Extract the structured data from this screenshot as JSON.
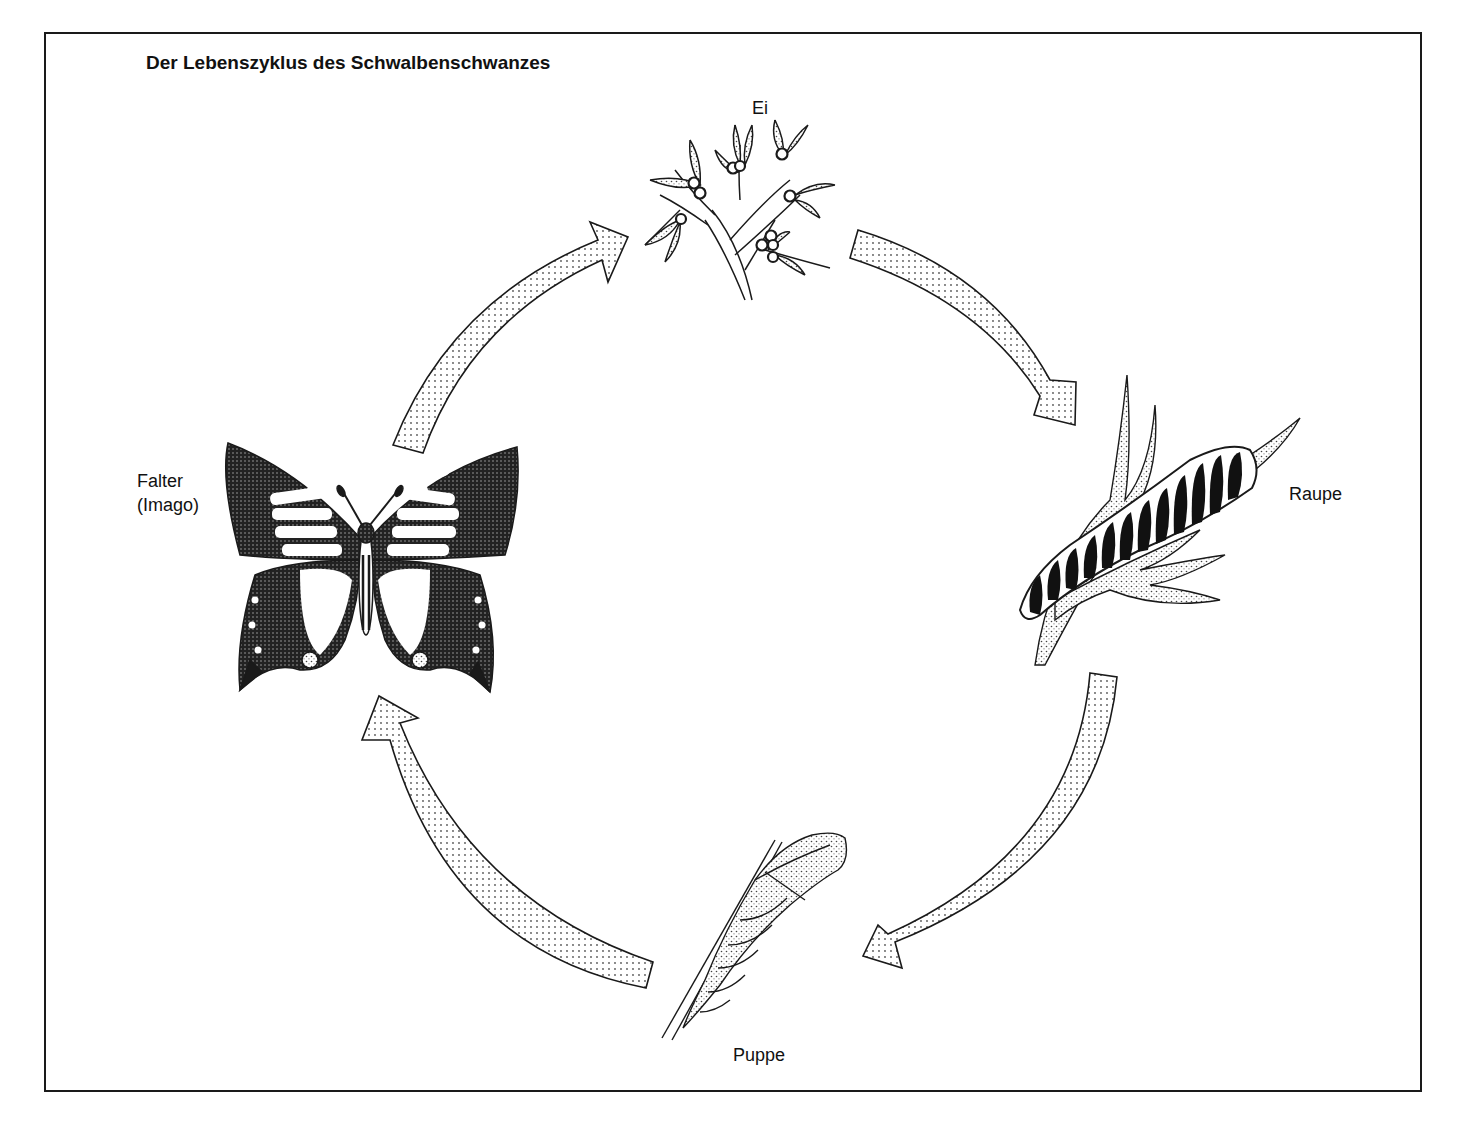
{
  "diagram": {
    "title": "Der Lebenszyklus des Schwalbenschwanzes",
    "type": "cycle",
    "stages": [
      {
        "id": "egg",
        "label": "Ei",
        "illustration": "eggs-on-plant-icon"
      },
      {
        "id": "caterpillar",
        "label": "Raupe",
        "illustration": "caterpillar-on-stem-icon"
      },
      {
        "id": "pupa",
        "label": "Puppe",
        "illustration": "chrysalis-icon"
      },
      {
        "id": "butterfly",
        "label_line1": "Falter",
        "label_line2": "(Imago)",
        "illustration": "swallowtail-butterfly-icon"
      }
    ],
    "arrows": [
      {
        "from": "butterfly",
        "to": "egg"
      },
      {
        "from": "egg",
        "to": "caterpillar"
      },
      {
        "from": "caterpillar",
        "to": "pupa"
      },
      {
        "from": "pupa",
        "to": "butterfly"
      }
    ],
    "colors": {
      "line": "#1a1a1a",
      "background": "#ffffff",
      "stipple": "#555555"
    }
  }
}
